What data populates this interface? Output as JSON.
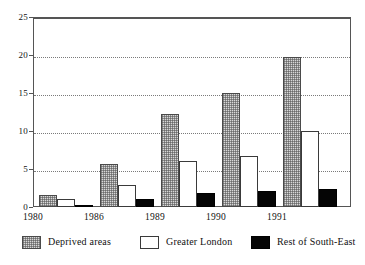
{
  "chart_data": {
    "type": "bar",
    "title": "",
    "subtitle": "",
    "xlabel": "",
    "ylabel": "",
    "categories": [
      "1980",
      "1986",
      "1989",
      "1990",
      "1991"
    ],
    "series": [
      {
        "name": "Deprived areas",
        "values": [
          1.6,
          5.7,
          12.3,
          15.0,
          19.7
        ],
        "fill": "stipple",
        "color": "#d8d8d8"
      },
      {
        "name": "Greater London",
        "values": [
          1.1,
          2.9,
          6.0,
          6.7,
          10.0
        ],
        "fill": "open",
        "color": "#ffffff"
      },
      {
        "name": "Rest of South-East",
        "values": [
          0.3,
          1.0,
          1.9,
          2.1,
          2.4
        ],
        "fill": "solid",
        "color": "#050505"
      }
    ],
    "ylim": [
      0,
      25
    ],
    "yticks": [
      0,
      5,
      10,
      15,
      20,
      25
    ],
    "ytick_labels": [
      "0",
      "5",
      "10",
      "15",
      "20",
      "25"
    ],
    "grid": true,
    "grid_axis": "y",
    "legend_position": "bottom",
    "legend_entries": [
      "Deprived areas",
      "Greater London",
      "Rest of South-East"
    ]
  },
  "axes": {
    "frame_color": "#555555",
    "grid_color": "#7a7a7a"
  }
}
